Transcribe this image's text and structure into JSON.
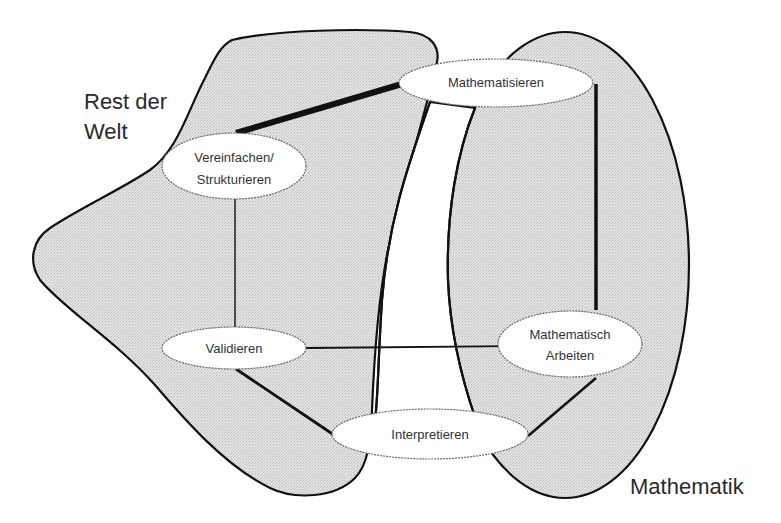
{
  "diagram": {
    "type": "modelling-cycle",
    "colors": {
      "region_fill": "#dcdcdc",
      "region_stroke": "#111111",
      "node_fill": "#ffffff",
      "background": "#ffffff"
    },
    "regions": [
      {
        "id": "rest-der-welt",
        "label_lines": [
          "Rest der",
          "Welt"
        ]
      },
      {
        "id": "mathematik",
        "label": "Mathematik"
      }
    ],
    "nodes": [
      {
        "id": "mathematisieren",
        "lines": [
          "Mathematisieren"
        ]
      },
      {
        "id": "vereinfachen",
        "lines": [
          "Vereinfachen/",
          "Strukturieren"
        ]
      },
      {
        "id": "validieren",
        "lines": [
          "Validieren"
        ]
      },
      {
        "id": "mathematisch-arbeiten",
        "lines": [
          "Mathematisch",
          "Arbeiten"
        ]
      },
      {
        "id": "interpretieren",
        "lines": [
          "Interpretieren"
        ]
      }
    ],
    "edges": [
      {
        "from": "vereinfachen",
        "to": "mathematisieren",
        "weight": "bold"
      },
      {
        "from": "mathematisieren",
        "to": "mathematisch-arbeiten",
        "weight": "medium"
      },
      {
        "from": "mathematisch-arbeiten",
        "to": "interpretieren",
        "weight": "medium"
      },
      {
        "from": "interpretieren",
        "to": "validieren",
        "weight": "medium"
      },
      {
        "from": "validieren",
        "to": "vereinfachen",
        "weight": "thin"
      },
      {
        "from": "validieren",
        "to": "mathematisch-arbeiten",
        "weight": "thin"
      }
    ]
  }
}
